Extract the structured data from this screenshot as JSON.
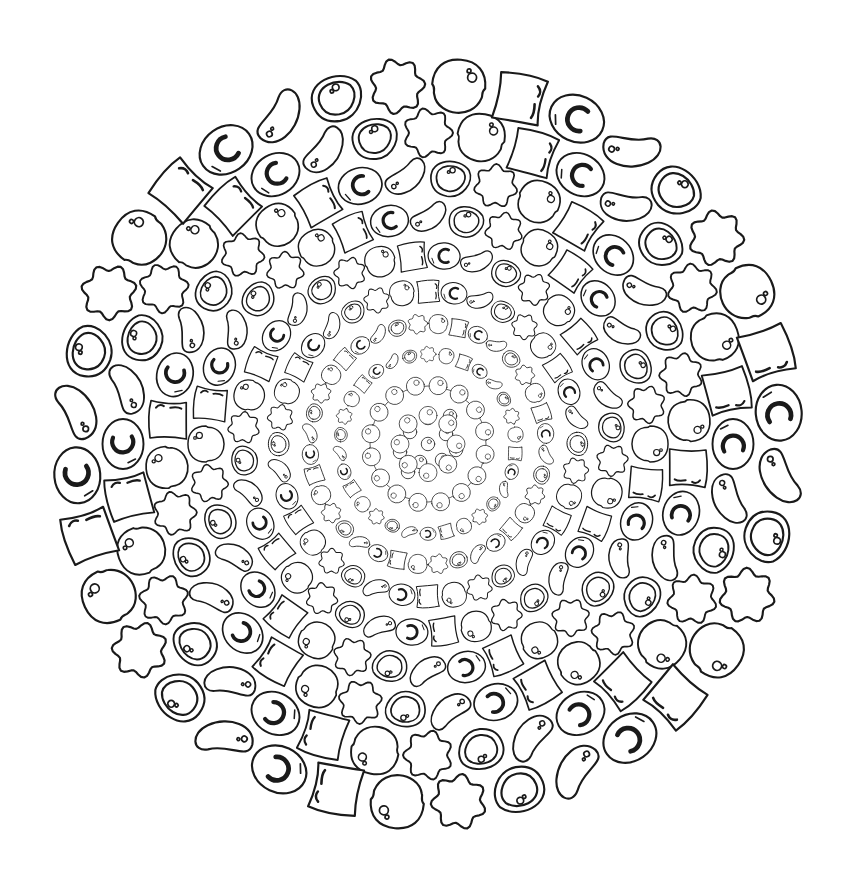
{
  "artwork": {
    "title": "Concentric mandala of outlined droplet shapes",
    "center": [
      428,
      444
    ],
    "stroke_color": "#1a1a1a",
    "background": "#ffffff",
    "shape_cycle": [
      "egg-crescent",
      "bean",
      "double-triangle",
      "flower",
      "bubble-circle",
      "square"
    ],
    "rings": [
      {
        "radius": 0,
        "count": 1,
        "size": 9,
        "rotation": 0
      },
      {
        "radius": 28,
        "count": 8,
        "size": 9,
        "rotation": 0,
        "type": "dot-ring"
      },
      {
        "radius": 58,
        "count": 16,
        "size": 9,
        "rotation": 10,
        "type": "dot-ring"
      },
      {
        "radius": 88,
        "count": 30,
        "size": 8,
        "rotation": 0
      },
      {
        "radius": 118,
        "count": 36,
        "size": 10,
        "rotation": 5
      },
      {
        "radius": 150,
        "count": 36,
        "size": 13,
        "rotation": 0
      },
      {
        "radius": 185,
        "count": 36,
        "size": 16,
        "rotation": 5
      },
      {
        "radius": 222,
        "count": 36,
        "size": 19,
        "rotation": 0
      },
      {
        "radius": 262,
        "count": 36,
        "size": 22,
        "rotation": 5
      },
      {
        "radius": 305,
        "count": 36,
        "size": 25,
        "rotation": 0
      },
      {
        "radius": 352,
        "count": 36,
        "size": 28,
        "rotation": 5
      }
    ]
  }
}
